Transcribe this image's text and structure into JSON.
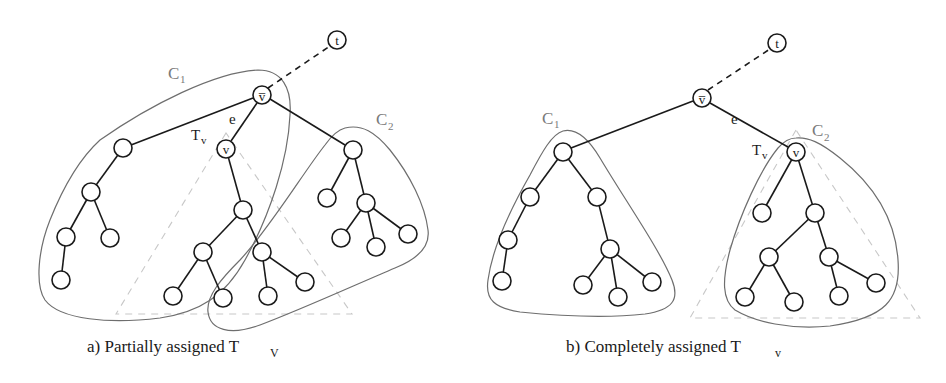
{
  "panels": [
    {
      "id": "a",
      "caption": "a) Partially assigned T",
      "caption_sub": "V",
      "labels": {
        "t": "t",
        "vbar": "v̅",
        "v": "v",
        "e": "e",
        "tv": "T",
        "tv_sub": "v",
        "c1": "C",
        "c1_sub": "1",
        "c2": "C",
        "c2_sub": "2"
      }
    },
    {
      "id": "b",
      "caption": "b) Completely assigned T",
      "caption_sub": "v",
      "labels": {
        "t": "t",
        "vbar": "v̅",
        "v": "v",
        "e": "e",
        "tv": "T",
        "tv_sub": "v",
        "c1": "C",
        "c1_sub": "1",
        "c2": "C",
        "c2_sub": "2"
      }
    }
  ],
  "colors": {
    "edge": "#1a1a1a",
    "hull": "#6e6e6e",
    "subtree_triangle": "#c8c8c8",
    "cluster_label": "#7a7a7a"
  }
}
